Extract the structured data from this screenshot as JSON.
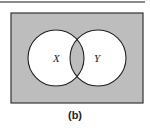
{
  "diagram": {
    "type": "venn",
    "universe": {
      "x": 11,
      "y": 13,
      "width": 132,
      "height": 90,
      "fill": "#bdbdbd",
      "stroke": "#333333"
    },
    "sets": [
      {
        "label": "X",
        "cx": 56,
        "cy": 58,
        "r": 28
      },
      {
        "label": "Y",
        "cx": 98,
        "cy": 58,
        "r": 28
      }
    ],
    "shaded_regions": [
      "outside X and Y",
      "X ∩ Y"
    ],
    "unshaded_regions": [
      "X only",
      "Y only"
    ],
    "shade_color": "#bdbdbd",
    "caption": "(b)"
  }
}
